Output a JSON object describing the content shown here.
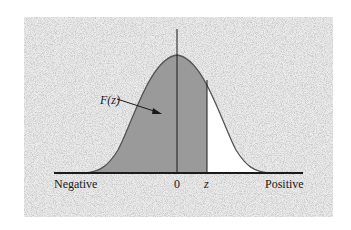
{
  "figure": {
    "title": "",
    "labels": {
      "area": "F(z)",
      "left_axis": "Negative",
      "origin": "0",
      "z_marker": "z",
      "right_axis": "Positive"
    },
    "colors": {
      "background_panel": "#e4e4e4",
      "shaded_area": "#9a9a9a",
      "unshaded_area": "#ffffff",
      "lines": "#1a1a1a",
      "curve": "#555555"
    },
    "geometry": {
      "panel": {
        "x": 24,
        "y": 17,
        "w": 309,
        "h": 200
      },
      "baseline_y": 173,
      "baseline_x": [
        54,
        303
      ],
      "origin_x": 177,
      "z_x": 207,
      "peak_y": 55,
      "axis_top_y": 29
    }
  }
}
